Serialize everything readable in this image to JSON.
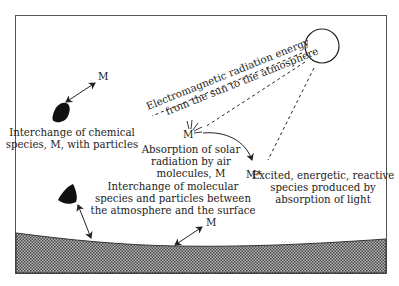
{
  "diagram": {
    "sun_label": "Electromagnetic radiation energy",
    "sun_label_line2": "from the sun to the atmosphere",
    "particle_top": {
      "species": "M",
      "caption_line1": "Interchange of chemical",
      "caption_line2": "species, M, with particles"
    },
    "absorption": {
      "species": "M",
      "caption_line1": "Absorption of solar",
      "caption_line2": "radiation by air",
      "caption_line3": "molecules, M"
    },
    "excited": {
      "species": "M*",
      "caption_line1": "Excited, energetic, reactive",
      "caption_line2": "species produced by",
      "caption_line3": "absorption of light"
    },
    "surface_exchange": {
      "species": "M",
      "caption_line1": "Interchange of molecular",
      "caption_line2": "species and particles between",
      "caption_line3": "the atmosphere and the surface"
    },
    "colors": {
      "border": "#555555",
      "ground_fill": "#8a8a8a",
      "ink": "#222222"
    }
  }
}
